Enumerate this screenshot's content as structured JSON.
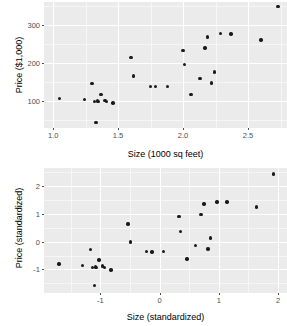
{
  "figure": {
    "background_color": "#ffffff",
    "panel_color": "#ebebeb",
    "gridline_color": "#ffffff",
    "point_color": "#1a1a1a",
    "axis_text_color": "#4d4d4d"
  },
  "chart_data": [
    {
      "type": "scatter",
      "title": "",
      "xlabel": "Size (1000 sq feet)",
      "ylabel": "Price ($1,000)",
      "xlim": [
        0.93,
        2.8
      ],
      "ylim": [
        30,
        360
      ],
      "xticks": [
        1.0,
        1.5,
        2.0,
        2.5
      ],
      "xticklabels": [
        "1.0",
        "1.5",
        "2.0",
        "2.5"
      ],
      "yticks": [
        100,
        200,
        300
      ],
      "yticklabels": [
        "100",
        "200",
        "300"
      ],
      "grid": true,
      "legend": "none",
      "x": [
        1.05,
        1.24,
        1.3,
        1.32,
        1.34,
        1.35,
        1.37,
        1.4,
        1.41,
        1.46,
        1.6,
        1.62,
        1.75,
        1.79,
        1.88,
        2.0,
        2.01,
        2.06,
        2.13,
        2.17,
        2.19,
        2.22,
        2.24,
        2.29,
        2.37,
        2.6,
        2.73,
        1.33
      ],
      "y": [
        108,
        105,
        147,
        100,
        101,
        100,
        118,
        102,
        100,
        95,
        214,
        166,
        139,
        138,
        139,
        233,
        196,
        118,
        159,
        240,
        268,
        148,
        177,
        277,
        276,
        261,
        349,
        45
      ]
    },
    {
      "type": "scatter",
      "title": "",
      "xlabel": "Size (standardized)",
      "ylabel": "Price (standardized)",
      "xlim": [
        -1.95,
        2.15
      ],
      "ylim": [
        -1.85,
        2.65
      ],
      "xticks": [
        -1,
        0,
        1,
        2
      ],
      "xticklabels": [
        "-1",
        "0",
        "1",
        "2"
      ],
      "yticks": [
        -1,
        0,
        1,
        2
      ],
      "yticklabels": [
        "-1",
        "0",
        "1",
        "2"
      ],
      "grid": true,
      "legend": "none",
      "x": [
        -1.7,
        -1.3,
        -1.17,
        -1.13,
        -1.08,
        -1.06,
        -1.02,
        -0.96,
        -0.93,
        -0.82,
        -0.53,
        -0.49,
        -0.22,
        -0.13,
        0.07,
        0.33,
        0.35,
        0.46,
        0.61,
        0.7,
        0.75,
        0.82,
        0.86,
        0.97,
        1.14,
        1.64,
        1.92,
        -1.1
      ],
      "y": [
        -0.8,
        -0.85,
        -0.28,
        -0.93,
        -0.91,
        -0.93,
        -0.66,
        -0.88,
        -0.93,
        -1.02,
        0.64,
        -0.01,
        -0.36,
        -0.38,
        -0.36,
        0.91,
        0.37,
        -0.62,
        -0.13,
        0.97,
        1.35,
        -0.27,
        0.13,
        1.43,
        1.42,
        1.25,
        2.44,
        -1.58
      ]
    }
  ]
}
